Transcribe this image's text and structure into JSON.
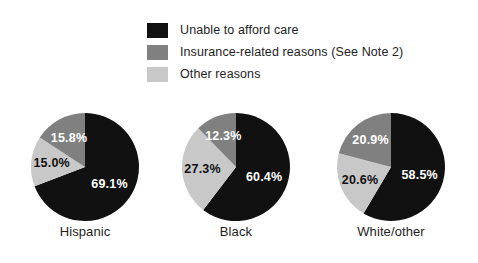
{
  "legend": {
    "items": [
      {
        "label": "Unable to afford care",
        "color": "#111111",
        "swatch_name": "legend-swatch-unable-to-afford-care"
      },
      {
        "label": "Insurance-related reasons (See Note 2)",
        "color": "#808080",
        "swatch_name": "legend-swatch-insurance-related-reasons"
      },
      {
        "label": "Other reasons",
        "color": "#c8c8c8",
        "swatch_name": "legend-swatch-other-reasons"
      }
    ]
  },
  "chart_data": {
    "type": "pie",
    "title": "",
    "subtitle": "",
    "xlabel": "",
    "ylabel": "",
    "grid": false,
    "legend_position": "top",
    "value_suffix": "%",
    "start_angle_deg": 0,
    "direction": "clockwise",
    "categories": [
      "Hispanic",
      "Black",
      "White/other"
    ],
    "series": [
      {
        "name": "Unable to afford care",
        "color": "#111111",
        "label_color": "#ffffff",
        "values": [
          69.1,
          60.4,
          58.5
        ]
      },
      {
        "name": "Other reasons",
        "color": "#c8c8c8",
        "label_color": "#111111",
        "values": [
          15.0,
          27.3,
          20.6
        ]
      },
      {
        "name": "Insurance-related reasons (See Note 2)",
        "color": "#808080",
        "label_color": "#ffffff",
        "values": [
          15.8,
          12.3,
          20.9
        ]
      }
    ],
    "charts": [
      {
        "category": "Hispanic",
        "slices": [
          {
            "name": "Unable to afford care",
            "value": 69.1,
            "display": "69.1%",
            "color": "#111111",
            "label_color": "#ffffff"
          },
          {
            "name": "Other reasons",
            "value": 15.0,
            "display": "15.0%",
            "color": "#c8c8c8",
            "label_color": "#111111"
          },
          {
            "name": "Insurance-related reasons (See Note 2)",
            "value": 15.8,
            "display": "15.8%",
            "color": "#808080",
            "label_color": "#ffffff"
          }
        ]
      },
      {
        "category": "Black",
        "slices": [
          {
            "name": "Unable to afford care",
            "value": 60.4,
            "display": "60.4%",
            "color": "#111111",
            "label_color": "#ffffff"
          },
          {
            "name": "Other reasons",
            "value": 27.3,
            "display": "27.3%",
            "color": "#c8c8c8",
            "label_color": "#111111"
          },
          {
            "name": "Insurance-related reasons (See Note 2)",
            "value": 12.3,
            "display": "12.3%",
            "color": "#808080",
            "label_color": "#ffffff"
          }
        ]
      },
      {
        "category": "White/other",
        "slices": [
          {
            "name": "Unable to afford care",
            "value": 58.5,
            "display": "58.5%",
            "color": "#111111",
            "label_color": "#ffffff"
          },
          {
            "name": "Other reasons",
            "value": 20.6,
            "display": "20.6%",
            "color": "#c8c8c8",
            "label_color": "#111111"
          },
          {
            "name": "Insurance-related reasons (See Note 2)",
            "value": 20.9,
            "display": "20.9%",
            "color": "#808080",
            "label_color": "#ffffff"
          }
        ]
      }
    ]
  }
}
